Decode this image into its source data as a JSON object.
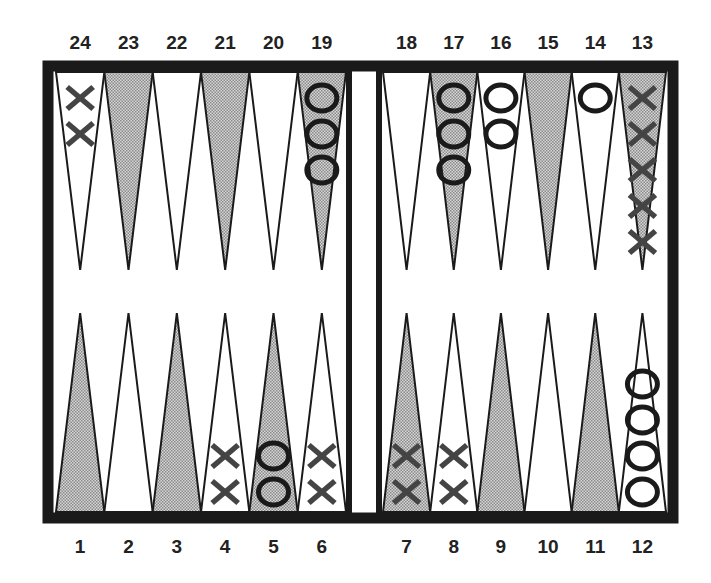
{
  "board": {
    "title": "Backgammon board",
    "colors": {
      "frame": "#1a1a1a",
      "shaded_point": "#b8b8b8",
      "light_point": "#ffffff",
      "x_checker": "#444444",
      "o_checker": "#1a1a1a"
    },
    "top_labels": [
      "24",
      "23",
      "22",
      "21",
      "20",
      "19",
      "18",
      "17",
      "16",
      "15",
      "14",
      "13"
    ],
    "bottom_labels": [
      "1",
      "2",
      "3",
      "4",
      "5",
      "6",
      "7",
      "8",
      "9",
      "10",
      "11",
      "12"
    ],
    "points": [
      {
        "number": 1,
        "shaded": true,
        "checker": "",
        "count": 0
      },
      {
        "number": 2,
        "shaded": false,
        "checker": "",
        "count": 0
      },
      {
        "number": 3,
        "shaded": true,
        "checker": "",
        "count": 0
      },
      {
        "number": 4,
        "shaded": false,
        "checker": "X",
        "count": 2
      },
      {
        "number": 5,
        "shaded": true,
        "checker": "O",
        "count": 2
      },
      {
        "number": 6,
        "shaded": false,
        "checker": "X",
        "count": 2
      },
      {
        "number": 7,
        "shaded": true,
        "checker": "X",
        "count": 2
      },
      {
        "number": 8,
        "shaded": false,
        "checker": "X",
        "count": 2
      },
      {
        "number": 9,
        "shaded": true,
        "checker": "",
        "count": 0
      },
      {
        "number": 10,
        "shaded": false,
        "checker": "",
        "count": 0
      },
      {
        "number": 11,
        "shaded": true,
        "checker": "",
        "count": 0
      },
      {
        "number": 12,
        "shaded": false,
        "checker": "O",
        "count": 4
      },
      {
        "number": 13,
        "shaded": true,
        "checker": "X",
        "count": 5
      },
      {
        "number": 14,
        "shaded": false,
        "checker": "O",
        "count": 1
      },
      {
        "number": 15,
        "shaded": true,
        "checker": "",
        "count": 0
      },
      {
        "number": 16,
        "shaded": false,
        "checker": "O",
        "count": 2
      },
      {
        "number": 17,
        "shaded": true,
        "checker": "O",
        "count": 3
      },
      {
        "number": 18,
        "shaded": false,
        "checker": "",
        "count": 0
      },
      {
        "number": 19,
        "shaded": true,
        "checker": "O",
        "count": 3
      },
      {
        "number": 20,
        "shaded": false,
        "checker": "",
        "count": 0
      },
      {
        "number": 21,
        "shaded": true,
        "checker": "",
        "count": 0
      },
      {
        "number": 22,
        "shaded": false,
        "checker": "",
        "count": 0
      },
      {
        "number": 23,
        "shaded": true,
        "checker": "",
        "count": 0
      },
      {
        "number": 24,
        "shaded": false,
        "checker": "X",
        "count": 2
      }
    ]
  }
}
